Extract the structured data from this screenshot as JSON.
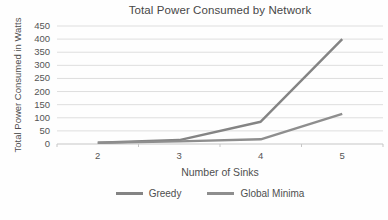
{
  "chart_data": {
    "type": "line",
    "title": "Total Power Consumed by Network",
    "xlabel": "Number of Sinks",
    "ylabel": "Total Power Consumed in Watts",
    "categories": [
      "2",
      "3",
      "4",
      "5"
    ],
    "series": [
      {
        "name": "Greedy",
        "values": [
          5,
          15,
          85,
          400
        ],
        "color": "#848484"
      },
      {
        "name": "Global Minima",
        "values": [
          5,
          10,
          18,
          115
        ],
        "color": "#8e8e8e"
      }
    ],
    "ylim": [
      0,
      450
    ],
    "ytick_step": 50,
    "grid": "horizontal",
    "legend_position": "bottom"
  },
  "colors": {
    "background": "#fefefe",
    "text": "#4f4f4f",
    "title_text": "#474747",
    "gridline": "#dedede",
    "axis": "#c6c6c6"
  }
}
